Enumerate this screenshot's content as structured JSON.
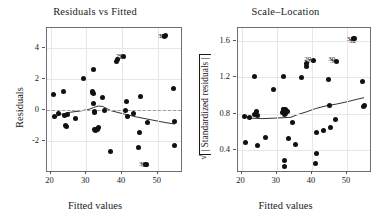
{
  "figure": {
    "kind": "regression-diagnostics",
    "panel_count": 2
  },
  "panels": [
    {
      "id": "residuals-vs-fitted",
      "title": "Residuals vs Fitted",
      "xlabel": "Fitted values",
      "ylabel": "Residuals",
      "xticks": [
        "20",
        "30",
        "40",
        "50"
      ],
      "yticks": [
        "-2",
        "0",
        "2",
        "4"
      ],
      "reference_line": "0"
    },
    {
      "id": "scale-location",
      "title": "Scale–Location",
      "xlabel": "Fitted values",
      "ylabel_sqrt": "√",
      "ylabel_inner": "| Standardized residuals |",
      "xticks": [
        "20",
        "30",
        "40",
        "50"
      ],
      "yticks": [
        "0.4",
        "0.8",
        "1.2",
        "1.6"
      ]
    }
  ],
  "point_labels": {
    "left": [
      "38",
      "32",
      "29",
      "24",
      "30",
      "39"
    ],
    "right": [
      "38",
      "32",
      "29",
      "24",
      "30",
      "34"
    ]
  },
  "chart_data": [
    {
      "type": "scatter",
      "title": "Residuals vs Fitted",
      "xlabel": "Fitted values",
      "ylabel": "Residuals",
      "xlim": [
        19.0,
        56.5
      ],
      "ylim": [
        -3.9,
        5.3
      ],
      "grid": true,
      "hline": 0,
      "xticks": [
        20,
        30,
        40,
        50
      ],
      "yticks": [
        -2,
        0,
        2,
        4
      ],
      "x": [
        20.8,
        21.1,
        22.2,
        23.6,
        23.8,
        24.2,
        24.4,
        24.6,
        26.9,
        29.2,
        31.6,
        31.8,
        31.9,
        32.0,
        32.1,
        32.2,
        32.3,
        32.4,
        32.5,
        32.6,
        33.2,
        33.4,
        34.6,
        35.2,
        36.9,
        38.4,
        38.6,
        40.5,
        41.0,
        41.2,
        41.4,
        43.2,
        44.6,
        45.0,
        45.2,
        46.7,
        46.9,
        47.0,
        51.9,
        52.2,
        54.4,
        54.6,
        54.8
      ],
      "y": [
        1.05,
        -0.38,
        -0.22,
        1.22,
        -0.32,
        -1.0,
        -1.02,
        -0.28,
        -0.52,
        2.05,
        1.22,
        1.12,
        1.08,
        2.62,
        0.42,
        -0.05,
        -0.15,
        -1.22,
        -1.25,
        -1.3,
        -1.2,
        -1.12,
        0.85,
        -0.02,
        -2.62,
        3.15,
        3.3,
        3.45,
        0.02,
        0.6,
        -0.38,
        -0.18,
        -2.4,
        -1.45,
        0.92,
        -3.45,
        -3.5,
        -0.78,
        4.75,
        4.8,
        1.38,
        -0.72,
        -2.28
      ],
      "smoother": {
        "name": "loess",
        "x": [
          20.8,
          23.0,
          25.5,
          28.0,
          30.5,
          32.0,
          33.3,
          34.6,
          36.9,
          40.0,
          44.0,
          48.0,
          52.0,
          54.8
        ],
        "y": [
          -0.48,
          -0.25,
          -0.12,
          -0.05,
          0.05,
          0.18,
          0.28,
          0.25,
          -0.02,
          -0.2,
          -0.42,
          -0.6,
          -0.78,
          -0.88
        ]
      },
      "labeled_points": [
        {
          "label": "38",
          "x": 52.0,
          "y": 4.8
        },
        {
          "label": "32",
          "x": 52.6,
          "y": 4.78
        },
        {
          "label": "24",
          "x": 41.0,
          "y": 3.45
        },
        {
          "label": "29",
          "x": 40.2,
          "y": 3.5
        },
        {
          "label": "39",
          "x": 46.7,
          "y": -3.48
        },
        {
          "label": "30",
          "x": 47.3,
          "y": -3.5
        }
      ]
    },
    {
      "type": "scatter",
      "title": "Scale–Location",
      "xlabel": "Fitted values",
      "ylabel": "√| Standardized residuals |",
      "xlim": [
        19.0,
        56.5
      ],
      "ylim": [
        0.17,
        1.74
      ],
      "grid": true,
      "xticks": [
        20,
        30,
        40,
        50
      ],
      "yticks": [
        0.4,
        0.8,
        1.2,
        1.6
      ],
      "x": [
        20.8,
        21.1,
        22.2,
        23.6,
        23.8,
        24.2,
        24.4,
        24.6,
        26.9,
        29.2,
        31.6,
        31.8,
        31.9,
        32.0,
        32.1,
        32.2,
        32.3,
        32.4,
        32.5,
        32.6,
        33.2,
        33.4,
        34.6,
        35.2,
        36.9,
        38.4,
        38.6,
        40.5,
        41.0,
        41.2,
        41.4,
        43.2,
        44.6,
        45.0,
        45.2,
        46.7,
        47.0,
        51.9,
        52.2,
        54.4,
        54.6,
        54.8
      ],
      "y": [
        0.77,
        0.48,
        0.76,
        1.21,
        0.79,
        0.82,
        0.78,
        0.45,
        0.54,
        1.07,
        0.81,
        0.84,
        0.85,
        1.21,
        0.79,
        0.28,
        0.22,
        0.8,
        0.83,
        0.84,
        0.82,
        0.53,
        0.7,
        0.46,
        1.2,
        1.32,
        1.35,
        1.38,
        0.25,
        0.59,
        0.36,
        0.62,
        1.17,
        0.89,
        0.65,
        0.73,
        1.37,
        1.62,
        1.63,
        1.15,
        0.88,
        0.89
      ],
      "smoother": {
        "name": "loess",
        "x": [
          20.8,
          23.0,
          26.0,
          29.0,
          32.0,
          34.0,
          36.0,
          38.5,
          41.0,
          44.0,
          47.0,
          50.0,
          52.5,
          54.8
        ],
        "y": [
          0.78,
          0.75,
          0.745,
          0.75,
          0.755,
          0.76,
          0.79,
          0.82,
          0.855,
          0.885,
          0.905,
          0.93,
          0.955,
          0.975
        ]
      },
      "labeled_points": [
        {
          "label": "38",
          "x": 51.9,
          "y": 1.62
        },
        {
          "label": "32",
          "x": 52.5,
          "y": 1.6
        },
        {
          "label": "24",
          "x": 40.5,
          "y": 1.38
        },
        {
          "label": "29",
          "x": 39.8,
          "y": 1.4
        },
        {
          "label": "30",
          "x": 46.6,
          "y": 1.4
        },
        {
          "label": "34",
          "x": 47.2,
          "y": 1.38
        }
      ]
    }
  ]
}
